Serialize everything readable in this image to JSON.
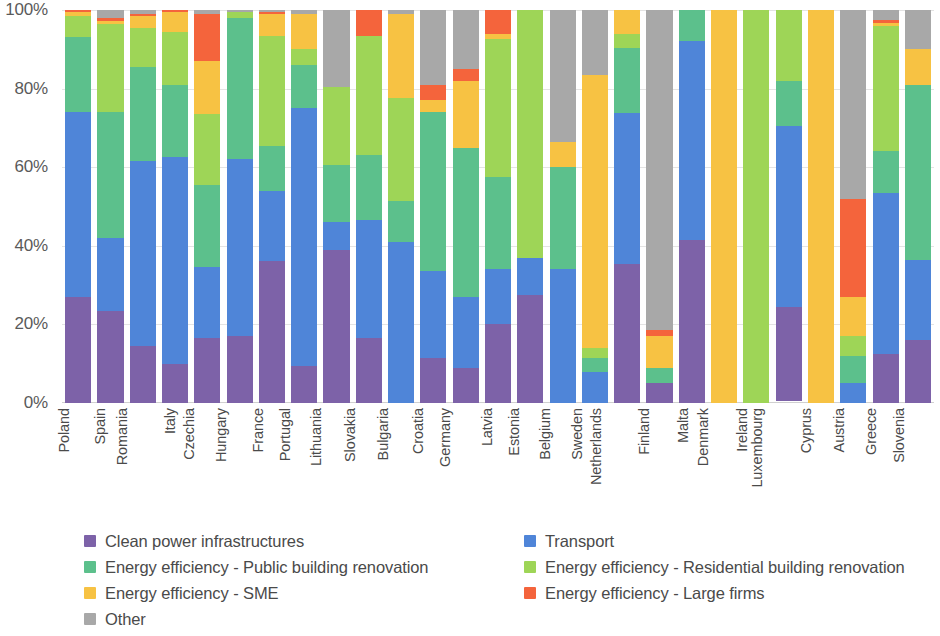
{
  "chart_data": {
    "type": "bar",
    "subtype": "stacked-percentage-column",
    "title": "",
    "subtitle": "",
    "xlabel": "",
    "ylabel": "",
    "ylim": [
      0,
      100
    ],
    "y_unit": "%",
    "grid": true,
    "legend_position": "bottom",
    "y_ticks": [
      "0%",
      "20%",
      "40%",
      "60%",
      "80%",
      "100%"
    ],
    "y_tick_values": [
      0,
      20,
      40,
      60,
      80,
      100
    ],
    "categories": [
      "Poland",
      "Spain",
      "Romania",
      "Italy",
      "Czechia",
      "Hungary",
      "France",
      "Portugal",
      "Lithuania",
      "Slovakia",
      "Bulgaria",
      "Croatia",
      "Germany",
      "Latvia",
      "Estonia",
      "Belgium",
      "Sweden",
      "Netherlands",
      "Finland",
      "Malta",
      "Denmark",
      "Ireland",
      "Luxembourg",
      "Cyprus",
      "Austria",
      "Greece",
      "Slovenia"
    ],
    "series": [
      {
        "name": "Clean power infrastructures",
        "color": "#7d62a8",
        "values": [
          27,
          23.5,
          14.5,
          10,
          16.5,
          17,
          36,
          9.5,
          39,
          16.5,
          0,
          11.5,
          9,
          20,
          27.5,
          0,
          0,
          44,
          5,
          41.5,
          0,
          0,
          24,
          0,
          0,
          12.5,
          16
        ]
      },
      {
        "name": "Transport",
        "color": "#4f85d8",
        "values": [
          47,
          18.5,
          47,
          52.5,
          18,
          45,
          18,
          65.5,
          7,
          30,
          41,
          22,
          18,
          14,
          9.5,
          34,
          8,
          48,
          0,
          50.5,
          0,
          0,
          46,
          0,
          5,
          41,
          20.5
        ]
      },
      {
        "name": "Energy efficiency - Public building renovation",
        "color": "#5cc08c",
        "values": [
          19,
          32,
          24,
          18.5,
          21,
          36,
          11.5,
          11,
          14.5,
          16.5,
          10.5,
          40.5,
          38,
          23.5,
          0,
          26,
          3.5,
          20.5,
          4,
          8,
          0,
          0,
          11.5,
          0,
          7,
          10.5,
          44.5
        ]
      },
      {
        "name": "Energy efficiency - Residential building renovation",
        "color": "#9ed557",
        "values": [
          5.5,
          22.5,
          10,
          13.5,
          18,
          1.5,
          28,
          4,
          20,
          30.5,
          26,
          0,
          0,
          35,
          63,
          0,
          2.5,
          4.5,
          0,
          0,
          0,
          100,
          18,
          0,
          5,
          32,
          0
        ]
      },
      {
        "name": "Energy efficiency - SME",
        "color": "#f7c243",
        "values": [
          1,
          0.8,
          3,
          5,
          13.5,
          0,
          5.5,
          9,
          0,
          0,
          21.5,
          3,
          17,
          1.5,
          0,
          6.5,
          69.5,
          7.5,
          8,
          0,
          100,
          0,
          0,
          100,
          10,
          0.8,
          9
        ]
      },
      {
        "name": "Energy efficiency - Large firms",
        "color": "#f4643c",
        "values": [
          0.5,
          0.7,
          0.5,
          0.5,
          12,
          0,
          0.5,
          0,
          0,
          6.5,
          0,
          4,
          3,
          6,
          0,
          0,
          0,
          0,
          1.5,
          0,
          0,
          0,
          0,
          0,
          25,
          0.7,
          0
        ]
      },
      {
        "name": "Other",
        "color": "#a8a8a8",
        "values": [
          0,
          2,
          1,
          0,
          1,
          0.5,
          0.5,
          1,
          19.5,
          0,
          1,
          19,
          15,
          0,
          0,
          33.5,
          16.5,
          0,
          81.5,
          0,
          0,
          0,
          0,
          0,
          48,
          2.5,
          10
        ]
      }
    ]
  },
  "y_axis": {
    "ticks": [
      {
        "label": "100%",
        "value": 100
      },
      {
        "label": "80%",
        "value": 80
      },
      {
        "label": "60%",
        "value": 60
      },
      {
        "label": "40%",
        "value": 40
      },
      {
        "label": "20%",
        "value": 20
      },
      {
        "label": "0%",
        "value": 0
      }
    ]
  },
  "legend": {
    "items": [
      {
        "label": "Clean power infrastructures",
        "color": "#7d62a8"
      },
      {
        "label": "Transport",
        "color": "#4f85d8"
      },
      {
        "label": "Energy efficiency - Public building renovation",
        "color": "#5cc08c"
      },
      {
        "label": "Energy efficiency - Residential building renovation",
        "color": "#9ed557"
      },
      {
        "label": "Energy efficiency - SME",
        "color": "#f7c243"
      },
      {
        "label": "Energy efficiency - Large firms",
        "color": "#f4643c"
      },
      {
        "label": "Other",
        "color": "#a8a8a8"
      }
    ]
  }
}
